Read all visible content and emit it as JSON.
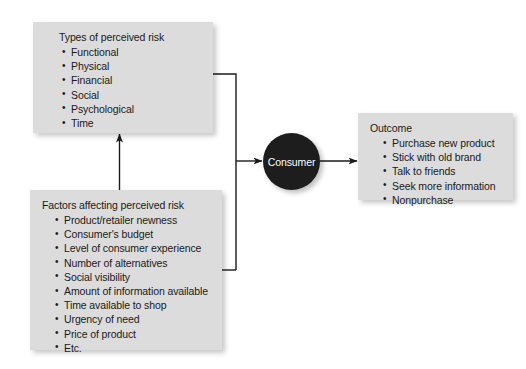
{
  "diagram": {
    "colors": {
      "box_fill": "#dcdcdc",
      "node_fill": "#1d1d1d",
      "node_text": "#ffffff",
      "connector": "#1a1a1a",
      "background": "#ffffff"
    },
    "boxes": {
      "types_of_risk": {
        "title": "Types of perceived risk",
        "bullets": [
          "Functional",
          "Physical",
          "Financial",
          "Social",
          "Psychological",
          "Time"
        ]
      },
      "factors": {
        "title": "Factors affecting perceived risk",
        "bullets": [
          "Product/retailer newness",
          "Consumer's budget",
          "Level of consumer experience",
          "Number of alternatives",
          "Social visibility",
          "Amount of information available",
          "Time available to shop",
          "Urgency of need",
          "Price of product",
          "Etc."
        ]
      },
      "outcome": {
        "title": "Outcome",
        "bullets": [
          "Purchase new product",
          "Stick with old brand",
          "Talk to friends",
          "Seek more information",
          "Nonpurchase"
        ]
      }
    },
    "node": {
      "label": "Consumer"
    },
    "connectors": [
      {
        "name": "factors-to-types",
        "style": "arrow-up"
      },
      {
        "name": "types-and-factors-to-consumer",
        "style": "arrow-right"
      },
      {
        "name": "consumer-to-outcome",
        "style": "arrow-right"
      }
    ]
  }
}
